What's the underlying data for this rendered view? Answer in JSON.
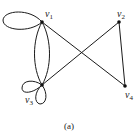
{
  "figure": {
    "caption": "(a)",
    "vertices": [
      {
        "id": "v1",
        "label": "v",
        "sub": "1"
      },
      {
        "id": "v2",
        "label": "v",
        "sub": "2"
      },
      {
        "id": "v3",
        "label": "v",
        "sub": "3"
      },
      {
        "id": "v4",
        "label": "v",
        "sub": "4"
      }
    ],
    "edges": [
      {
        "from": "v1",
        "to": "v1",
        "type": "loop"
      },
      {
        "from": "v1",
        "to": "v3",
        "type": "parallel"
      },
      {
        "from": "v1",
        "to": "v3",
        "type": "parallel"
      },
      {
        "from": "v1",
        "to": "v4",
        "type": "straight"
      },
      {
        "from": "v3",
        "to": "v2",
        "type": "straight"
      },
      {
        "from": "v2",
        "to": "v4",
        "type": "straight"
      },
      {
        "from": "v3",
        "to": "v3",
        "type": "loop"
      },
      {
        "from": "v3",
        "to": "v3",
        "type": "loop"
      }
    ]
  }
}
